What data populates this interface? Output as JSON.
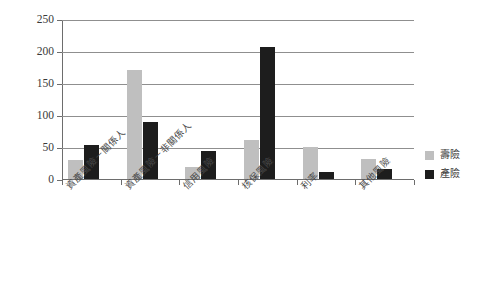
{
  "chart_data": {
    "type": "bar",
    "title": "",
    "subtitle": "",
    "xlabel": "",
    "ylabel": "",
    "ylim": [
      0,
      250
    ],
    "ytick_step": 50,
    "yticks": [
      "0",
      "50",
      "100",
      "150",
      "200",
      "250"
    ],
    "grid": true,
    "legend_position": "right",
    "categories": [
      "資產風險－關係人",
      "資產風險－非關係人",
      "信用風險",
      "核保風險",
      "利率",
      "其他風險"
    ],
    "series": [
      {
        "name": "壽險",
        "color": "#bfbfbf",
        "values": [
          29,
          170,
          19,
          61,
          50,
          31
        ]
      },
      {
        "name": "產險",
        "color": "#1d1d1d",
        "values": [
          53,
          89,
          43,
          206,
          11,
          15
        ]
      }
    ]
  },
  "legend": {
    "items": [
      {
        "label": "壽險",
        "color": "#bfbfbf"
      },
      {
        "label": "產險",
        "color": "#1d1d1d"
      }
    ]
  }
}
